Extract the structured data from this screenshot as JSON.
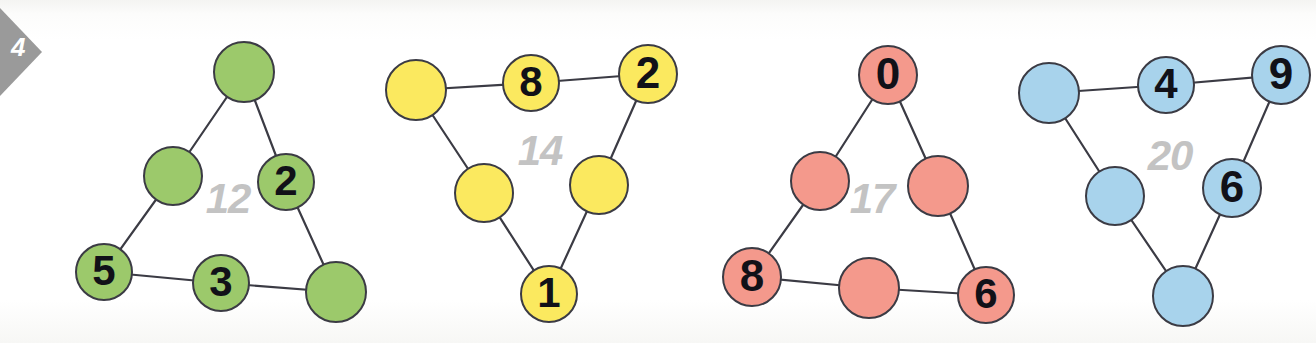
{
  "exercise": {
    "marker_number": "4",
    "marker_color": "#9a9a9a"
  },
  "canvas": {
    "width": 1316,
    "height": 343,
    "background": "#ffffff"
  },
  "puzzles": [
    {
      "id": "green-triangle",
      "sum_label": "12",
      "fill": "#9cc96b",
      "stroke": "#3b3b44",
      "sum_pos": {
        "x": 228,
        "y": 200
      },
      "nodes": [
        {
          "name": "node-top",
          "value": "",
          "cx": 244,
          "cy": 72,
          "r": 31
        },
        {
          "name": "node-mid-left",
          "value": "",
          "cx": 173,
          "cy": 176,
          "r": 30
        },
        {
          "name": "node-mid-right",
          "value": "2",
          "cx": 286,
          "cy": 182,
          "r": 29
        },
        {
          "name": "node-bottom-left",
          "value": "5",
          "cx": 104,
          "cy": 272,
          "r": 29
        },
        {
          "name": "node-bottom-mid",
          "value": "3",
          "cx": 221,
          "cy": 283,
          "r": 29
        },
        {
          "name": "node-bottom-right",
          "value": "",
          "cx": 336,
          "cy": 292,
          "r": 31
        }
      ],
      "edges": [
        [
          0,
          1
        ],
        [
          0,
          2
        ],
        [
          1,
          3
        ],
        [
          2,
          5
        ],
        [
          3,
          4
        ],
        [
          4,
          5
        ]
      ]
    },
    {
      "id": "yellow-triangle",
      "sum_label": "14",
      "fill": "#fbe95f",
      "stroke": "#3b3b44",
      "sum_pos": {
        "x": 540,
        "y": 152
      },
      "nodes": [
        {
          "name": "node-top-left",
          "value": "",
          "cx": 416,
          "cy": 90,
          "r": 31
        },
        {
          "name": "node-top-mid",
          "value": "8",
          "cx": 531,
          "cy": 83,
          "r": 29
        },
        {
          "name": "node-top-right",
          "value": "2",
          "cx": 648,
          "cy": 74,
          "r": 30
        },
        {
          "name": "node-mid-left",
          "value": "",
          "cx": 484,
          "cy": 193,
          "r": 30
        },
        {
          "name": "node-mid-right",
          "value": "",
          "cx": 599,
          "cy": 185,
          "r": 30
        },
        {
          "name": "node-bottom",
          "value": "1",
          "cx": 549,
          "cy": 294,
          "r": 29
        }
      ],
      "edges": [
        [
          0,
          1
        ],
        [
          1,
          2
        ],
        [
          0,
          3
        ],
        [
          2,
          4
        ],
        [
          3,
          5
        ],
        [
          4,
          5
        ]
      ]
    },
    {
      "id": "red-triangle",
      "sum_label": "17",
      "fill": "#f4998c",
      "stroke": "#3b3b44",
      "sum_pos": {
        "x": 872,
        "y": 200
      },
      "nodes": [
        {
          "name": "node-top",
          "value": "0",
          "cx": 888,
          "cy": 75,
          "r": 30
        },
        {
          "name": "node-mid-left",
          "value": "",
          "cx": 820,
          "cy": 181,
          "r": 30
        },
        {
          "name": "node-mid-right",
          "value": "",
          "cx": 938,
          "cy": 186,
          "r": 31
        },
        {
          "name": "node-bottom-left",
          "value": "8",
          "cx": 752,
          "cy": 277,
          "r": 30
        },
        {
          "name": "node-bottom-mid",
          "value": "",
          "cx": 869,
          "cy": 288,
          "r": 31
        },
        {
          "name": "node-bottom-right",
          "value": "6",
          "cx": 986,
          "cy": 295,
          "r": 29
        }
      ],
      "edges": [
        [
          0,
          1
        ],
        [
          0,
          2
        ],
        [
          1,
          3
        ],
        [
          2,
          5
        ],
        [
          3,
          4
        ],
        [
          4,
          5
        ]
      ]
    },
    {
      "id": "blue-triangle",
      "sum_label": "20",
      "fill": "#a8d3ec",
      "stroke": "#3b3b44",
      "sum_pos": {
        "x": 1170,
        "y": 157
      },
      "nodes": [
        {
          "name": "node-top-left",
          "value": "",
          "cx": 1049,
          "cy": 93,
          "r": 31
        },
        {
          "name": "node-top-mid",
          "value": "4",
          "cx": 1166,
          "cy": 85,
          "r": 29
        },
        {
          "name": "node-top-right",
          "value": "9",
          "cx": 1281,
          "cy": 75,
          "r": 30
        },
        {
          "name": "node-mid-left",
          "value": "",
          "cx": 1115,
          "cy": 196,
          "r": 30
        },
        {
          "name": "node-mid-right",
          "value": "6",
          "cx": 1232,
          "cy": 188,
          "r": 30
        },
        {
          "name": "node-bottom",
          "value": "",
          "cx": 1183,
          "cy": 296,
          "r": 31
        }
      ],
      "edges": [
        [
          0,
          1
        ],
        [
          1,
          2
        ],
        [
          0,
          3
        ],
        [
          2,
          4
        ],
        [
          3,
          5
        ],
        [
          4,
          5
        ]
      ]
    }
  ]
}
